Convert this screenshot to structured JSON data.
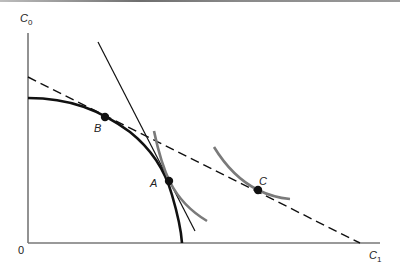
{
  "figure": {
    "axes": {
      "y_label": "C",
      "y_label_sub": "0",
      "x_label": "C",
      "x_label_sub": "1",
      "origin_label": "0"
    },
    "points": [
      {
        "id": "A",
        "label": "A",
        "x": 169,
        "y": 181
      },
      {
        "id": "B",
        "label": "B",
        "x": 105,
        "y": 117
      },
      {
        "id": "C",
        "label": "C",
        "x": 258,
        "y": 190
      }
    ],
    "curves": {
      "production_frontier": "solid thick concave curve from C0 axis to C1 axis",
      "market_line": "dashed straight line tangent at B, through C",
      "tangent_at_A": "thin steep straight line through A",
      "indifference_A": "gray convex curve through A",
      "indifference_C": "gray convex curve through C"
    },
    "colors": {
      "axis": "#777777",
      "curve": "#111111",
      "indifference": "#7a7a7a",
      "point": "#111111"
    }
  }
}
